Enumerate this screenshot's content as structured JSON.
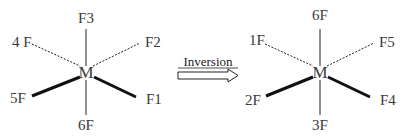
{
  "diagram": {
    "left": {
      "center": "M",
      "top": "F3",
      "upper_left": "4 F",
      "upper_right": "F2",
      "lower_left": "5F",
      "lower_right": "F1",
      "bottom": "6F"
    },
    "arrow": {
      "label": "Inversion"
    },
    "right": {
      "center": "M",
      "top": "6F",
      "upper_left": "1F",
      "upper_right": "F5",
      "lower_left": "2F",
      "lower_right": "F4",
      "bottom": "3F"
    },
    "colors": {
      "line": "#222222",
      "text": "#3a3a3a"
    }
  }
}
